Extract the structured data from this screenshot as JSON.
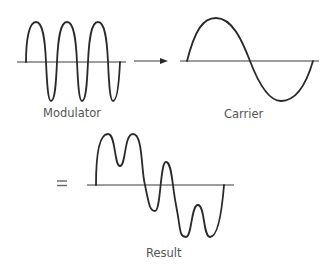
{
  "diagram": {
    "title": "",
    "panels": [
      {
        "id": "modulator",
        "label": "Modulator",
        "description": "high-frequency sine wave, ~3.5 cycles"
      },
      {
        "id": "carrier",
        "label": "Carrier",
        "description": "low-frequency sine wave, 1 cycle"
      },
      {
        "id": "result",
        "label": "Result",
        "description": "combined waveform: carrier shape with modulator ripples"
      }
    ],
    "operators": {
      "arrow": "→",
      "equals": "="
    },
    "colors": {
      "stroke": "#2a2a2a",
      "axis": "#3a3a3a",
      "label": "#555555",
      "background": "#ffffff"
    }
  }
}
